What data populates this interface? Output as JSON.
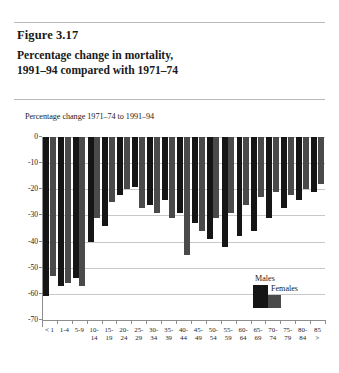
{
  "header": {
    "running_head": "",
    "figure_number": "Figure 3.17",
    "figure_title": "Percentage change in mortality,\n1991–94 compared with 1971–74",
    "figure_title_line1": "Percentage change in mortality,",
    "figure_title_line2": "1991–94 compared with 1971–74"
  },
  "legend": {
    "males_label": "Males",
    "females_label": "Females"
  },
  "colors": {
    "males": "#151515",
    "females": "#4a4a4a",
    "grid": "#c8c8c8",
    "axis": "#8d8d8d",
    "background": "#ffffff"
  },
  "chart_data": {
    "type": "bar",
    "title": "Percentage change in mortality, 1991–94 compared with 1971–74",
    "subtitle": "Percentage change 1971–74 to 1991–94",
    "xlabel": "",
    "ylabel": "",
    "ylim": [
      -70,
      0
    ],
    "yticks": [
      0,
      -10,
      -20,
      -30,
      -40,
      -50,
      -60,
      -70
    ],
    "ytick_labels": [
      "0",
      "-10",
      "-20",
      "-30",
      "-40",
      "-50",
      "-60",
      "-70"
    ],
    "grid": true,
    "legend_position": "inside-bottom-right",
    "categories": [
      "< 1",
      "1-4",
      "5-9",
      "10-14",
      "15-19",
      "20-24",
      "25-29",
      "30-34",
      "35-39",
      "40-44",
      "45-49",
      "50-54",
      "55-59",
      "60-64",
      "65-69",
      "70-74",
      "75-79",
      "80-84",
      "85 >"
    ],
    "category_lines": [
      [
        "< 1",
        ""
      ],
      [
        "1-4",
        ""
      ],
      [
        "5-9",
        ""
      ],
      [
        "10-",
        "14"
      ],
      [
        "15-",
        "19"
      ],
      [
        "20-",
        "24"
      ],
      [
        "25-",
        "29"
      ],
      [
        "30-",
        "34"
      ],
      [
        "35-",
        "39"
      ],
      [
        "40-",
        "44"
      ],
      [
        "45-",
        "49"
      ],
      [
        "50-",
        "54"
      ],
      [
        "55-",
        "59"
      ],
      [
        "60-",
        "64"
      ],
      [
        "65-",
        "69"
      ],
      [
        "70-",
        "74"
      ],
      [
        "75-",
        "79"
      ],
      [
        "80-",
        "84"
      ],
      [
        "85",
        ">"
      ]
    ],
    "series": [
      {
        "name": "Males",
        "color": "#151515",
        "values": [
          -61,
          -57,
          -54,
          -40,
          -34,
          -22,
          -19,
          -26,
          -24,
          -29,
          -33,
          -39,
          -42,
          -38,
          -36,
          -31,
          -27,
          -24,
          -21
        ]
      },
      {
        "name": "Females",
        "color": "#4a4a4a",
        "values": [
          -53,
          -56,
          -57,
          -31,
          -25,
          -20,
          -27,
          -29,
          -31,
          -45,
          -36,
          -31,
          -29,
          -26,
          -23,
          -21,
          -22,
          -20,
          -18
        ]
      }
    ]
  }
}
